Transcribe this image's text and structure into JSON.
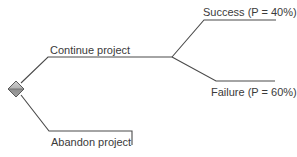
{
  "diagram": {
    "type": "decision-tree",
    "colors": {
      "line": "#4a4a4a",
      "text": "#3a3a3a",
      "decision_node_fill_top": "#c8c8c8",
      "decision_node_fill_bottom": "#8c8c8c",
      "background": "#ffffff"
    },
    "decision_node": {
      "icon": "diamond-decision-node-icon"
    },
    "branches": [
      {
        "label": "Continue project",
        "children": [
          {
            "label": "Success (P = 40%)"
          },
          {
            "label": "Failure (P = 60%)"
          }
        ]
      },
      {
        "label": "Abandon project",
        "children": []
      }
    ]
  }
}
